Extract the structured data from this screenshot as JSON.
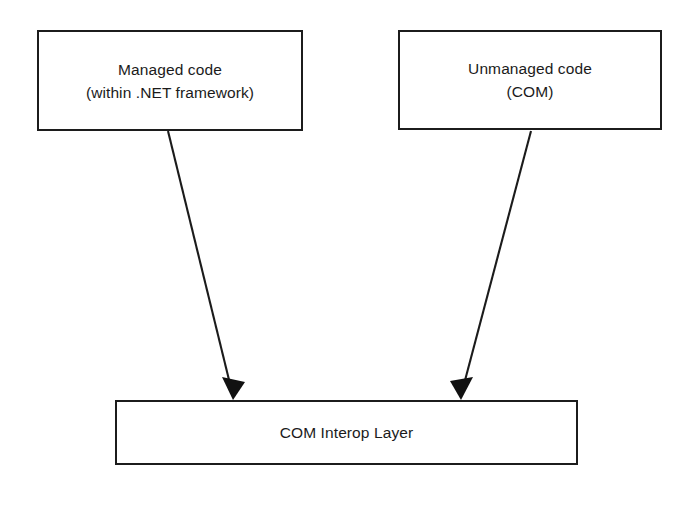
{
  "diagram": {
    "background_color": "#ffffff",
    "stroke_color": "#1b1b1b",
    "text_color": "#1b1b1b",
    "nodes": [
      {
        "id": "managed-code",
        "line1": "Managed code",
        "line2": "(within .NET framework)"
      },
      {
        "id": "unmanaged-code",
        "line1": "Unmanaged code",
        "line2": "(COM)"
      },
      {
        "id": "com-interop-layer",
        "line1": "COM Interop Layer"
      }
    ],
    "edges": [
      {
        "id": "managed-to-interop",
        "from": "managed-code",
        "to": "com-interop-layer",
        "label": "",
        "arrowhead": "filled-triangle",
        "direction": "down-right"
      },
      {
        "id": "unmanaged-to-interop",
        "from": "unmanaged-code",
        "to": "com-interop-layer",
        "label": "",
        "arrowhead": "filled-triangle",
        "direction": "down-left"
      }
    ]
  }
}
